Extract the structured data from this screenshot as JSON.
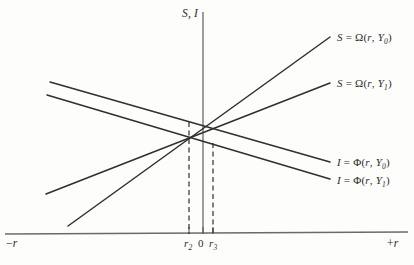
{
  "figure": {
    "type": "economics-line-diagram",
    "background_color": "#fdfdfb",
    "line_color": "#2f2f2f",
    "axis_color": "#555555"
  },
  "axes": {
    "vertical_label": "S, I",
    "left_label_prefix": "−",
    "left_label_var": "r",
    "right_label_prefix": "+",
    "right_label_var": "r",
    "origin_label": "0",
    "x_axis_y": 234,
    "y_axis_x": 203,
    "y_axis_top": 12,
    "x_axis_left": 5,
    "x_axis_right": 408
  },
  "ticks": [
    {
      "name": "r2",
      "base": "r",
      "sub": "2",
      "x": 189
    },
    {
      "name": "zero",
      "base": "0",
      "sub": "",
      "x": 203
    },
    {
      "name": "r3",
      "base": "r",
      "sub": "3",
      "x": 213
    }
  ],
  "curves": [
    {
      "id": "saving-y0",
      "label_var": "S",
      "label_eq": "=",
      "label_fn": "Ω",
      "label_args_open": "(",
      "label_arg1": "r",
      "label_comma": ",",
      "label_arg2": "Y",
      "label_sub": "0",
      "label_args_close": ")",
      "slope_direction": "upward",
      "x1": 68,
      "y1": 226,
      "x2": 330,
      "y2": 37,
      "label_x": 337,
      "label_y": 31
    },
    {
      "id": "saving-y1",
      "label_var": "S",
      "label_eq": "=",
      "label_fn": "Ω",
      "label_args_open": "(",
      "label_arg1": "r",
      "label_comma": ",",
      "label_arg2": "Y",
      "label_sub": "1",
      "label_args_close": ")",
      "slope_direction": "upward",
      "x1": 46,
      "y1": 194,
      "x2": 330,
      "y2": 83,
      "label_x": 337,
      "label_y": 77
    },
    {
      "id": "investment-y0",
      "label_var": "I",
      "label_eq": "=",
      "label_fn": "Φ",
      "label_args_open": "(",
      "label_arg1": "r",
      "label_comma": ",",
      "label_arg2": "Y",
      "label_sub": "0",
      "label_args_close": ")",
      "slope_direction": "downward",
      "x1": 50,
      "y1": 82,
      "x2": 330,
      "y2": 162,
      "label_x": 337,
      "label_y": 156
    },
    {
      "id": "investment-y1",
      "label_var": "I",
      "label_eq": "=",
      "label_fn": "Φ",
      "label_args_open": "(",
      "label_arg1": "r",
      "label_comma": ",",
      "label_arg2": "Y",
      "label_sub": "1",
      "label_args_close": ")",
      "slope_direction": "downward",
      "x1": 47,
      "y1": 95,
      "x2": 330,
      "y2": 179,
      "label_x": 337,
      "label_y": 174
    }
  ],
  "equilibria": [
    {
      "id": "eq-r2",
      "x": 189,
      "y": 122,
      "drop_to_y": 234
    },
    {
      "id": "eq-r3",
      "x": 213,
      "y": 143,
      "drop_to_y": 234
    }
  ],
  "chart_data": {
    "type": "line",
    "title": "",
    "xlabel": "r",
    "ylabel": "S, I",
    "xlim": [
      -1,
      1
    ],
    "ylim": [
      0,
      1
    ],
    "grid": false,
    "legend": "inline-right",
    "series": [
      {
        "name": "S = Ω (r, Y0)",
        "slope": "positive",
        "points": [
          [
            68,
            226
          ],
          [
            330,
            37
          ]
        ]
      },
      {
        "name": "S = Ω (r, Y1)",
        "slope": "positive",
        "points": [
          [
            46,
            194
          ],
          [
            330,
            83
          ]
        ]
      },
      {
        "name": "I = Φ (r, Y0)",
        "slope": "negative",
        "points": [
          [
            50,
            82
          ],
          [
            330,
            162
          ]
        ]
      },
      {
        "name": "I = Φ (r, Y1)",
        "slope": "negative",
        "points": [
          [
            47,
            95
          ],
          [
            330,
            179
          ]
        ]
      }
    ],
    "annotations": [
      "r2",
      "0",
      "r3",
      "−r",
      "+r",
      "S, I"
    ]
  }
}
